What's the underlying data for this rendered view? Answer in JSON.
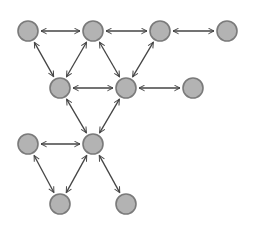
{
  "diagram": {
    "type": "network-graph",
    "edge_style": "bidirectional-arrow",
    "colors": {
      "background": "#ffffff",
      "node_fill": "#b3b3b3",
      "node_stroke": "#7a7a7a",
      "edge": "#444444"
    },
    "node_radius": 10,
    "nodes": [
      {
        "id": "n1",
        "x": 28,
        "y": 31
      },
      {
        "id": "n2",
        "x": 93,
        "y": 31
      },
      {
        "id": "n3",
        "x": 160,
        "y": 31
      },
      {
        "id": "n4",
        "x": 227,
        "y": 31
      },
      {
        "id": "n5",
        "x": 60,
        "y": 88
      },
      {
        "id": "n6",
        "x": 126,
        "y": 88
      },
      {
        "id": "n7",
        "x": 193,
        "y": 88
      },
      {
        "id": "n8",
        "x": 28,
        "y": 144
      },
      {
        "id": "n9",
        "x": 93,
        "y": 144
      },
      {
        "id": "n10",
        "x": 60,
        "y": 204
      },
      {
        "id": "n11",
        "x": 126,
        "y": 204
      }
    ],
    "edges": [
      [
        "n1",
        "n2"
      ],
      [
        "n2",
        "n3"
      ],
      [
        "n3",
        "n4"
      ],
      [
        "n1",
        "n5"
      ],
      [
        "n2",
        "n5"
      ],
      [
        "n2",
        "n6"
      ],
      [
        "n3",
        "n6"
      ],
      [
        "n5",
        "n6"
      ],
      [
        "n6",
        "n7"
      ],
      [
        "n5",
        "n9"
      ],
      [
        "n6",
        "n9"
      ],
      [
        "n8",
        "n9"
      ],
      [
        "n8",
        "n10"
      ],
      [
        "n9",
        "n10"
      ],
      [
        "n9",
        "n11"
      ]
    ]
  }
}
